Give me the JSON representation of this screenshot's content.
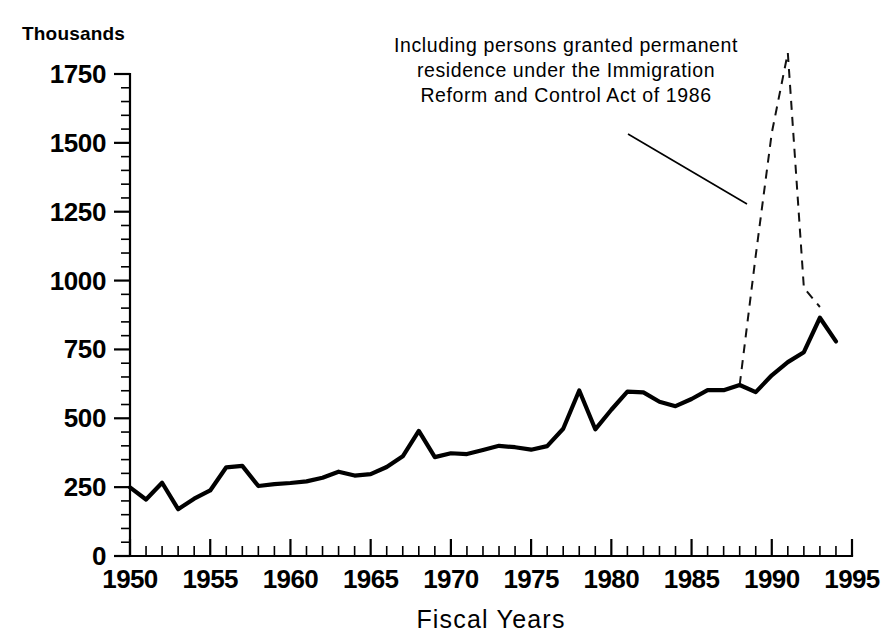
{
  "chart_data": {
    "type": "line",
    "title": "",
    "subtitle": "",
    "unit_label": "Thousands",
    "xlabel": "Fiscal Years",
    "ylabel": "",
    "xlim": [
      1950,
      1995
    ],
    "ylim": [
      0,
      1750
    ],
    "grid": false,
    "legend": "none",
    "y_ticks": [
      0,
      250,
      500,
      750,
      1000,
      1250,
      1500,
      1750
    ],
    "y_tick_labels": [
      "0",
      "250",
      "500",
      "750",
      "1000",
      "1250",
      "1500",
      "1750"
    ],
    "y_minor_step": 50,
    "x_ticks": [
      1950,
      1955,
      1960,
      1965,
      1970,
      1975,
      1980,
      1985,
      1990,
      1995
    ],
    "x_tick_labels": [
      "1950",
      "1955",
      "1960",
      "1965",
      "1970",
      "1975",
      "1980",
      "1985",
      "1990",
      "1995"
    ],
    "x_minor_step": 1,
    "annotations": [
      {
        "name": "irca-note",
        "lines": [
          "Including persons granted permanent",
          "residence under the Immigration",
          "Reform and Control Act of 1986"
        ],
        "has_leader_line": true
      }
    ],
    "series": [
      {
        "name": "Immigrants admitted (excluding IRCA legalizations)",
        "style": "solid",
        "x": [
          1950,
          1951,
          1952,
          1953,
          1954,
          1955,
          1956,
          1957,
          1958,
          1959,
          1960,
          1961,
          1962,
          1963,
          1964,
          1965,
          1966,
          1967,
          1968,
          1969,
          1970,
          1971,
          1972,
          1973,
          1974,
          1975,
          1976,
          1977,
          1978,
          1979,
          1980,
          1981,
          1982,
          1983,
          1984,
          1985,
          1986,
          1987,
          1988,
          1989,
          1990,
          1991,
          1992,
          1993,
          1994
        ],
        "values": [
          249,
          205,
          266,
          170,
          208,
          238,
          322,
          327,
          254,
          261,
          265,
          271,
          284,
          306,
          292,
          297,
          323,
          362,
          454,
          359,
          373,
          370,
          385,
          400,
          395,
          386,
          399,
          462,
          601,
          460,
          531,
          597,
          594,
          560,
          544,
          570,
          602,
          602,
          621,
          595,
          656,
          704,
          740,
          865,
          779
        ]
      },
      {
        "name": "Total admissions including IRCA legalizations",
        "style": "dashed",
        "x": [
          1988,
          1989,
          1990,
          1991,
          1992,
          1993
        ],
        "values": [
          621,
          1091,
          1536,
          1827,
          974,
          904
        ]
      }
    ]
  },
  "axis": {
    "unit_label": "Thousands",
    "x_title": "Fiscal Years"
  }
}
